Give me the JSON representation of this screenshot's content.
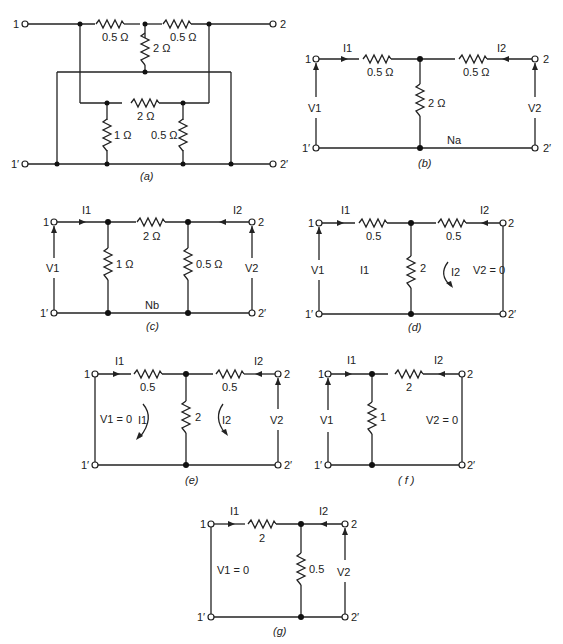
{
  "figures": [
    {
      "id": "a",
      "caption": "(a)",
      "labels": {
        "r_top_left": "0.5 Ω",
        "r_top_right": "0.5 Ω",
        "r_mid": "2 Ω",
        "r_inner": "2 Ω",
        "r_left_shunt": "1 Ω",
        "r_right_shunt": "0.5 Ω",
        "t1": "1",
        "t1p": "1′",
        "t2": "2",
        "t2p": "2′"
      }
    },
    {
      "id": "b",
      "caption": "(b)",
      "labels": {
        "i1": "I1",
        "i2": "I2",
        "r1": "0.5 Ω",
        "r2": "0.5 Ω",
        "r3": "2 Ω",
        "v1": "V1",
        "v2": "V2",
        "net": "Na",
        "t1": "1",
        "t1p": "1′",
        "t2": "2",
        "t2p": "2′"
      }
    },
    {
      "id": "c",
      "caption": "(c)",
      "labels": {
        "i1": "I1",
        "i2": "I2",
        "r_series": "2 Ω",
        "r_left": "1 Ω",
        "r_right": "0.5 Ω",
        "v1": "V1",
        "v2": "V2",
        "net": "Nb",
        "t1": "1",
        "t1p": "1′",
        "t2": "2",
        "t2p": "2′"
      }
    },
    {
      "id": "d",
      "caption": "(d)",
      "labels": {
        "i1": "I1",
        "i2": "I2",
        "r1": "0.5",
        "r2": "0.5",
        "r3": "2",
        "v1": "V1",
        "loop1": "I1",
        "loop2": "I2",
        "v2": "V2 = 0",
        "t1": "1",
        "t1p": "1′",
        "t2": "2",
        "t2p": "2′"
      }
    },
    {
      "id": "e",
      "caption": "(e)",
      "labels": {
        "i1": "I1",
        "i2": "I2",
        "r1": "0.5",
        "r2": "0.5",
        "r3": "2",
        "v1": "V1 = 0",
        "loop1": "I1",
        "loop2": "I2",
        "v2": "V2",
        "t1": "1",
        "t1p": "1′",
        "t2": "2",
        "t2p": "2′"
      }
    },
    {
      "id": "f",
      "caption": "( f )",
      "labels": {
        "i1": "I1",
        "i2": "I2",
        "r_series": "2",
        "r_shunt": "1",
        "v1": "V1",
        "v2": "V2 = 0",
        "t1": "1",
        "t1p": "1′",
        "t2": "2",
        "t2p": "2′"
      }
    },
    {
      "id": "g",
      "caption": "(g)",
      "labels": {
        "i1": "I1",
        "i2": "I2",
        "r_series": "2",
        "r_shunt": "0.5",
        "v1": "V1 = 0",
        "v2": "V2",
        "t1": "1",
        "t1p": "1′",
        "t2": "2",
        "t2p": "2′"
      }
    }
  ]
}
